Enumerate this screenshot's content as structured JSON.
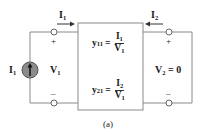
{
  "figure": {
    "caption": "(a)",
    "left_port": {
      "current_label": "I",
      "current_sub": "1",
      "voltage_label": "V",
      "voltage_sub": "1",
      "source_label": "I",
      "source_sub": "1",
      "plus": "+",
      "minus": "–"
    },
    "right_port": {
      "current_label": "I",
      "current_sub": "2",
      "voltage_label": "V",
      "voltage_sub": "2",
      "voltage_value": " = 0",
      "plus": "+",
      "minus": "–"
    },
    "network": {
      "eq1": {
        "lhs": "y",
        "lhs_sub": "11",
        "equals": "=",
        "num": "I",
        "num_sub": "1",
        "den": "V",
        "den_sub": "1"
      },
      "eq2": {
        "lhs": "y",
        "lhs_sub": "21",
        "equals": "=",
        "num": "I",
        "num_sub": "2",
        "den": "V",
        "den_sub": "1"
      }
    },
    "colors": {
      "wire": "#8a8a8a",
      "box": "#8a8a8a",
      "source_fill": "#8c8c8c",
      "text": "#1a1a1a"
    }
  }
}
